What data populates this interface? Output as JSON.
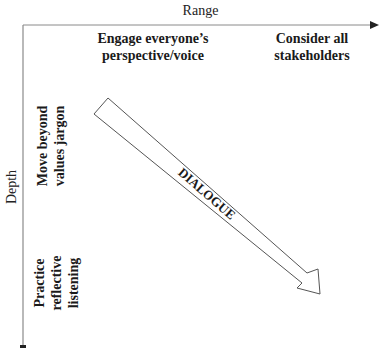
{
  "axes": {
    "x_title": "Range",
    "y_title": "Depth"
  },
  "range_items": [
    {
      "line1": "Engage everyone’s",
      "line2": "perspective/voice"
    },
    {
      "line1": "Consider all",
      "line2": "stakeholders"
    }
  ],
  "depth_items": [
    {
      "line1": "Move beyond",
      "line2": "values jargon"
    },
    {
      "line1": "Practice",
      "line2": "reflective",
      "line3": "listening"
    }
  ],
  "arrow": {
    "label": "DIALOGUE"
  },
  "colors": {
    "line": "#555555",
    "text": "#1a1a1a"
  }
}
